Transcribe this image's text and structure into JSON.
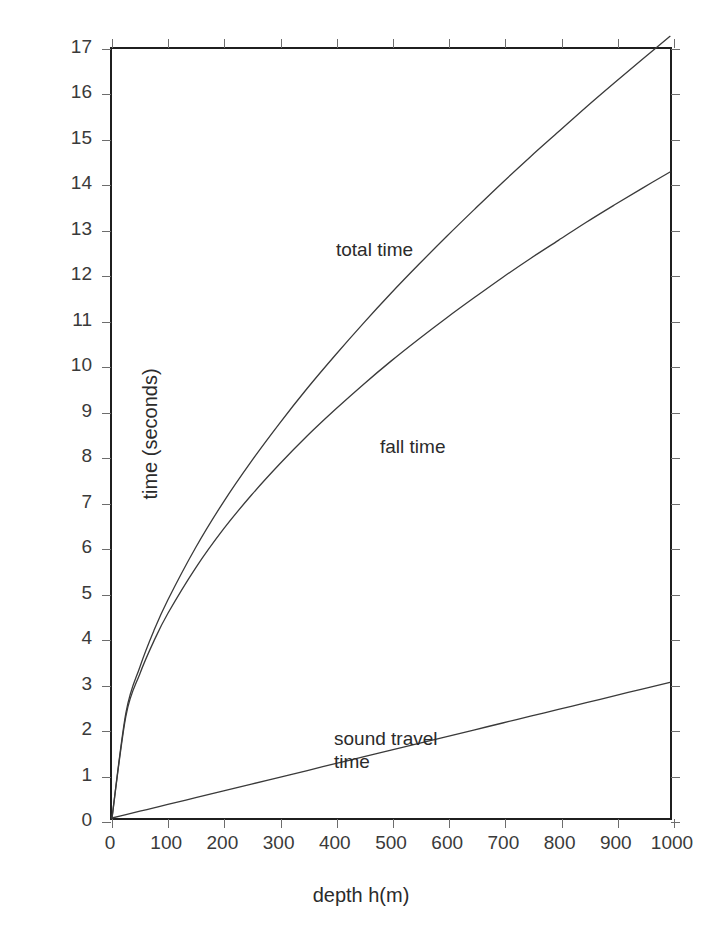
{
  "chart_data": {
    "type": "line",
    "title": "",
    "xlabel": "depth h(m)",
    "ylabel": "time (seconds)",
    "xlim": [
      0,
      1000
    ],
    "ylim": [
      0,
      17
    ],
    "grid": false,
    "legend_position": "inline-annotations",
    "xticks": [
      0,
      100,
      200,
      300,
      400,
      500,
      600,
      700,
      800,
      900,
      1000
    ],
    "yticks": [
      0,
      1,
      2,
      3,
      4,
      5,
      6,
      7,
      8,
      9,
      10,
      11,
      12,
      13,
      14,
      15,
      16,
      17
    ],
    "xtick_labels": [
      "0",
      "100",
      "200",
      "300",
      "400",
      "500",
      "600",
      "700",
      "800",
      "900",
      "1000"
    ],
    "ytick_labels": [
      "0",
      "1",
      "2",
      "3",
      "4",
      "5",
      "6",
      "7",
      "8",
      "9",
      "10",
      "11",
      "12",
      "13",
      "14",
      "15",
      "16",
      "17"
    ],
    "x": [
      0,
      25,
      50,
      75,
      100,
      150,
      200,
      250,
      300,
      350,
      400,
      450,
      500,
      550,
      600,
      650,
      700,
      750,
      800,
      850,
      900,
      950,
      1000
    ],
    "series": [
      {
        "name": "total time",
        "color": "#3a3a3a",
        "values": [
          0.0,
          2.33,
          3.34,
          4.14,
          4.82,
          5.98,
          6.99,
          7.89,
          8.72,
          9.5,
          10.23,
          10.93,
          11.6,
          12.24,
          12.86,
          13.46,
          14.05,
          14.62,
          15.17,
          15.72,
          16.25,
          16.77,
          17.28
        ]
      },
      {
        "name": "fall time",
        "color": "#3a3a3a",
        "values": [
          0.0,
          2.26,
          3.19,
          3.91,
          4.52,
          5.53,
          6.39,
          7.14,
          7.82,
          8.45,
          9.03,
          9.58,
          10.1,
          10.59,
          11.06,
          11.51,
          11.95,
          12.37,
          12.77,
          13.17,
          13.55,
          13.92,
          14.28
        ]
      },
      {
        "name": "sound travel time",
        "color": "#3a3a3a",
        "values": [
          0.0,
          0.075,
          0.15,
          0.225,
          0.3,
          0.45,
          0.6,
          0.75,
          0.9,
          1.05,
          1.2,
          1.35,
          1.5,
          1.65,
          1.8,
          1.95,
          2.1,
          2.25,
          2.4,
          2.55,
          2.7,
          2.85,
          3.0
        ]
      }
    ],
    "annotations": [
      {
        "name": "total time",
        "text": "total time",
        "x": 430,
        "y": 13.6
      },
      {
        "name": "fall time",
        "text": "fall time",
        "x": 520,
        "y": 9.2
      },
      {
        "name": "sound travel time",
        "text": "sound travel\ntime",
        "x": 470,
        "y": 2.9
      }
    ]
  },
  "axes": {
    "x_title": "depth h(m)",
    "y_title": "time (seconds)"
  },
  "annotations": {
    "total_time": "total time",
    "fall_time": "fall time",
    "sound_travel_time": "sound travel\ntime"
  },
  "colors": {
    "frame": "#1f1f1f",
    "curve": "#3a3a3a",
    "tick": "#6d6d6d",
    "text": "#2b2b2b",
    "background": "#ffffff"
  }
}
